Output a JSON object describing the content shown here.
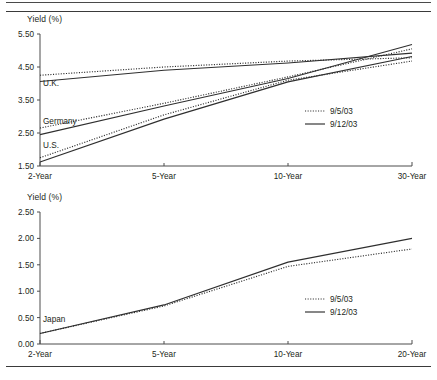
{
  "page": {
    "background": "#ffffff",
    "line_color": "#2f2f2f",
    "axis_color": "#4d4d4d"
  },
  "legend": {
    "dotted_label": "9/5/03",
    "solid_label": "9/12/03"
  },
  "chart_data": [
    {
      "type": "line",
      "title": "",
      "xlabel": "",
      "ylabel": "Yield (%)",
      "categories": [
        "2-Year",
        "5-Year",
        "10-Year",
        "30-Year"
      ],
      "x": [
        0,
        1,
        2,
        3
      ],
      "ylim": [
        1.5,
        5.5
      ],
      "yticks": [
        "1.50",
        "2.50",
        "3.50",
        "4.50",
        "5.50"
      ],
      "ytick_values": [
        1.5,
        2.5,
        3.5,
        4.5,
        5.5
      ],
      "grid": false,
      "legend_position": "right-middle",
      "annotations": [
        "U.K.",
        "Germany",
        "U.S."
      ],
      "series": [
        {
          "name": "U.K. 9/5/03",
          "country": "U.K.",
          "date": "9/5/03",
          "style": "dotted",
          "values": [
            4.25,
            4.5,
            4.68,
            4.78
          ]
        },
        {
          "name": "U.K. 9/12/03",
          "country": "U.K.",
          "date": "9/12/03",
          "style": "solid",
          "values": [
            4.06,
            4.4,
            4.62,
            4.92
          ]
        },
        {
          "name": "Germany 9/5/03",
          "country": "Germany",
          "date": "9/5/03",
          "style": "dotted",
          "values": [
            2.65,
            3.4,
            4.2,
            5.05
          ]
        },
        {
          "name": "Germany 9/12/03",
          "country": "Germany",
          "date": "9/12/03",
          "style": "solid",
          "values": [
            2.45,
            3.32,
            4.15,
            5.18
          ]
        },
        {
          "name": "U.S. 9/5/03",
          "country": "U.S.",
          "date": "9/5/03",
          "style": "dotted",
          "values": [
            1.75,
            3.05,
            4.1,
            4.68
          ]
        },
        {
          "name": "U.S. 9/12/03",
          "country": "U.S.",
          "date": "9/12/03",
          "style": "solid",
          "values": [
            1.62,
            2.92,
            4.05,
            4.82
          ]
        }
      ]
    },
    {
      "type": "line",
      "title": "",
      "xlabel": "",
      "ylabel": "Yield (%)",
      "categories": [
        "2-Year",
        "5-Year",
        "10-Year",
        "20-Year"
      ],
      "x": [
        0,
        1,
        2,
        3
      ],
      "ylim": [
        0.0,
        2.5
      ],
      "yticks": [
        "0.00",
        "0.50",
        "1.00",
        "1.50",
        "2.00",
        "2.50"
      ],
      "ytick_values": [
        0.0,
        0.5,
        1.0,
        1.5,
        2.0,
        2.5
      ],
      "grid": false,
      "legend_position": "right-middle",
      "annotations": [
        "Japan"
      ],
      "series": [
        {
          "name": "Japan 9/5/03",
          "country": "Japan",
          "date": "9/5/03",
          "style": "dotted",
          "values": [
            0.2,
            0.72,
            1.47,
            1.8
          ]
        },
        {
          "name": "Japan 9/12/03",
          "country": "Japan",
          "date": "9/12/03",
          "style": "solid",
          "values": [
            0.2,
            0.74,
            1.55,
            2.0
          ]
        }
      ]
    }
  ]
}
